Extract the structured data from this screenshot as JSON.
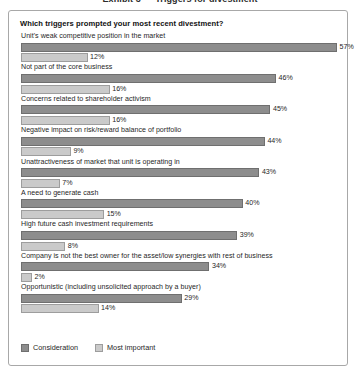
{
  "exhibit": {
    "header": "Exhibit 3 — Triggers for divestment"
  },
  "chart": {
    "title": "Which triggers prompted your most recent divestment?",
    "legend": [
      {
        "key": "consideration",
        "label": "Consideration",
        "color": "#8d8d8d"
      },
      {
        "key": "most_important",
        "label": "Most important",
        "color": "#cacaca"
      }
    ]
  },
  "chart_data": {
    "type": "bar",
    "orientation": "horizontal",
    "title": "Which triggers prompted your most recent divestment?",
    "xlabel": "",
    "ylabel": "",
    "xlim": [
      0,
      57
    ],
    "grid": false,
    "legend_position": "bottom-left",
    "value_suffix": "%",
    "categories": [
      "Unit's weak competitive position in the market",
      "Not part of the core business",
      "Concerns related to shareholder activism",
      "Negative impact on risk/reward balance of portfolio",
      "Unattractiveness of market that unit is operating in",
      "A need to generate cash",
      "High future cash investment requirements",
      "Company is not the best owner for the asset/low synergies with rest of business",
      "Opportunistic (including unsolicited approach by a buyer)"
    ],
    "series": [
      {
        "name": "Consideration",
        "values": [
          57,
          46,
          45,
          44,
          43,
          40,
          39,
          34,
          29
        ],
        "labels": [
          "57%",
          "46%",
          "45%",
          "44%",
          "43%",
          "40%",
          "39%",
          "34%",
          "29%"
        ]
      },
      {
        "name": "Most important",
        "values": [
          12,
          16,
          16,
          9,
          7,
          15,
          8,
          2,
          14
        ],
        "labels": [
          "12%",
          "16%",
          "16%",
          "9%",
          "7%",
          "15%",
          "8%",
          "2%",
          "14%"
        ]
      }
    ]
  }
}
